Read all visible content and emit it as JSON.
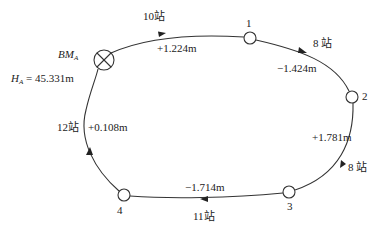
{
  "benchmark": {
    "label": "BM",
    "label_sub": "A",
    "height_symbol": "H",
    "height_sub": "A",
    "height_value": " = 45.331m"
  },
  "points": [
    {
      "id": "1",
      "label": "1"
    },
    {
      "id": "2",
      "label": "2"
    },
    {
      "id": "3",
      "label": "3"
    },
    {
      "id": "4",
      "label": "4"
    }
  ],
  "segments": [
    {
      "from": "BMA",
      "to": "1",
      "stations": "10站",
      "height_diff": "+1.224m"
    },
    {
      "from": "1",
      "to": "2",
      "stations": "8 站",
      "height_diff": "−1.424m"
    },
    {
      "from": "2",
      "to": "3",
      "stations": "8 站",
      "height_diff": "+1.781m"
    },
    {
      "from": "3",
      "to": "4",
      "stations": "11站",
      "height_diff": "−1.714m"
    },
    {
      "from": "4",
      "to": "BMA",
      "stations": "12站",
      "height_diff": "+0.108m"
    }
  ],
  "colors": {
    "line": "#333333",
    "node_fill": "#ffffff"
  }
}
